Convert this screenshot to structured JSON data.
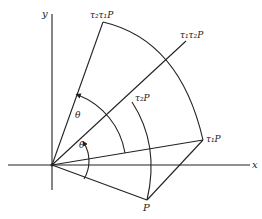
{
  "figure": {
    "axes": {
      "x_label": "x",
      "y_label": "y"
    },
    "points": {
      "P": "P",
      "tau1_P": "τ₁P",
      "tau2_P": "τ₂P",
      "tau2_tau1_P": "τ₂τ₁P",
      "tau1_tau2_P": "τ₁τ₂P"
    },
    "angles": {
      "upper": "θ",
      "lower": "θ"
    },
    "colors": {
      "stroke": "#222222",
      "background": "#ffffff"
    }
  }
}
